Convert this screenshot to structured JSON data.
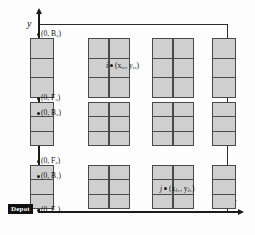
{
  "figure": {
    "colors": {
      "cell_fill": "#cfcfcf",
      "block_border": "#4a4a4a",
      "axis": "#1b1b1b",
      "boundary": "#2b2b2b",
      "depot_bg": "#111111",
      "depot_text": "#ffffff"
    }
  },
  "axes": {
    "y_label": "y",
    "x_label": "x"
  },
  "depot": {
    "label": "Depot"
  },
  "tick_labels": [
    {
      "text": "(0, B₃)"
    },
    {
      "text": "(0, F₃)"
    },
    {
      "text": "(0, B₂)"
    },
    {
      "text": "(0, F₂)"
    },
    {
      "text": "(0, B₁)"
    },
    {
      "text": "(0, F₁)"
    }
  ],
  "annotations": [
    {
      "id": "i",
      "coords": "(xᵢ₃, yᵢ₃)"
    },
    {
      "id": "j",
      "coords": "(xⱼ₁, yⱼ₁)"
    }
  ],
  "blocks": [
    {
      "name": "block-r3-c1",
      "cols": 1,
      "rows": 3,
      "x": 30,
      "y": 38,
      "w": 24,
      "h": 60
    },
    {
      "name": "block-r3-c2",
      "cols": 2,
      "rows": 3,
      "x": 88,
      "y": 38,
      "w": 42,
      "h": 60
    },
    {
      "name": "block-r3-c3",
      "cols": 2,
      "rows": 3,
      "x": 152,
      "y": 38,
      "w": 42,
      "h": 60
    },
    {
      "name": "block-r3-c4",
      "cols": 1,
      "rows": 3,
      "x": 212,
      "y": 38,
      "w": 24,
      "h": 60
    },
    {
      "name": "block-r2-c1",
      "cols": 1,
      "rows": 3,
      "x": 30,
      "y": 102,
      "w": 24,
      "h": 44
    },
    {
      "name": "block-r2-c2",
      "cols": 2,
      "rows": 3,
      "x": 88,
      "y": 102,
      "w": 42,
      "h": 44
    },
    {
      "name": "block-r2-c3",
      "cols": 2,
      "rows": 3,
      "x": 152,
      "y": 102,
      "w": 42,
      "h": 44
    },
    {
      "name": "block-r2-c4",
      "cols": 1,
      "rows": 3,
      "x": 212,
      "y": 102,
      "w": 24,
      "h": 44
    },
    {
      "name": "block-r1-c1",
      "cols": 1,
      "rows": 3,
      "x": 30,
      "y": 165,
      "w": 24,
      "h": 44
    },
    {
      "name": "block-r1-c2",
      "cols": 2,
      "rows": 3,
      "x": 88,
      "y": 165,
      "w": 42,
      "h": 44
    },
    {
      "name": "block-r1-c3",
      "cols": 2,
      "rows": 3,
      "x": 152,
      "y": 165,
      "w": 42,
      "h": 44
    },
    {
      "name": "block-r1-c4",
      "cols": 1,
      "rows": 3,
      "x": 212,
      "y": 165,
      "w": 24,
      "h": 44
    }
  ]
}
